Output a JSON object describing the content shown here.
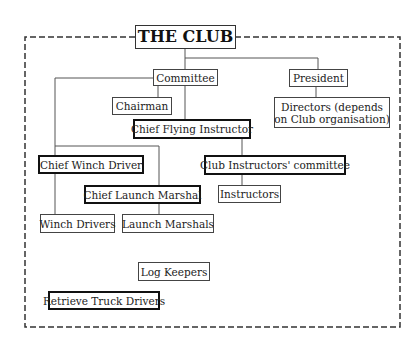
{
  "diagram": {
    "title": "THE CLUB",
    "nodes": {
      "committee": "Committee",
      "president": "President",
      "chairman": "Chairman",
      "directors_line1": "Directors (depends",
      "directors_line2": "on Club organisation)",
      "chief_flying_instructor": "Chief Flying Instructor",
      "chief_winch_driver": "Chief Winch Driver",
      "club_instructors_committee": "Club Instructors' committee",
      "chief_launch_marshal": "Chief Launch Marshal",
      "instructors": "Instructors",
      "winch_drivers": "Winch Drivers",
      "launch_marshals": "Launch Marshals",
      "log_keepers": "Log Keepers",
      "retrieve_truck_drivers": "Retrieve Truck Drivers"
    },
    "edges": [
      [
        "THE CLUB",
        "Committee"
      ],
      [
        "THE CLUB",
        "President"
      ],
      [
        "Committee",
        "Chairman"
      ],
      [
        "Committee",
        "Chief Flying Instructor"
      ],
      [
        "Committee",
        "Chief Winch Driver"
      ],
      [
        "Committee",
        "Chief Launch Marshal"
      ],
      [
        "President",
        "Directors (depends on Club organisation)"
      ],
      [
        "Chief Flying Instructor",
        "Club Instructors' committee"
      ],
      [
        "Club Instructors' committee",
        "Instructors"
      ],
      [
        "Chief Winch Driver",
        "Winch Drivers"
      ],
      [
        "Chief Launch Marshal",
        "Launch Marshals"
      ]
    ]
  }
}
